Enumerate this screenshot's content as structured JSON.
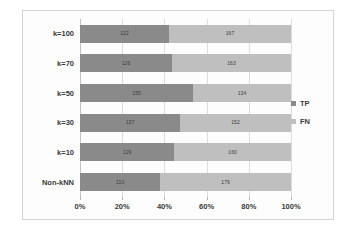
{
  "chart_data": {
    "type": "bar",
    "orientation": "horizontal",
    "stacked": true,
    "normalized_percent": true,
    "title": "",
    "xlabel": "",
    "ylabel": "",
    "categories": [
      "k=100",
      "k=70",
      "k=50",
      "k=30",
      "k=10",
      "Non-kNN"
    ],
    "series": [
      {
        "name": "TP",
        "color": "#8a8a8a",
        "values": [
          122,
          126,
          155,
          137,
          129,
          110
        ]
      },
      {
        "name": "FN",
        "color": "#bfbfbf",
        "values": [
          167,
          163,
          134,
          152,
          160,
          179
        ]
      }
    ],
    "row_totals": [
      289,
      289,
      289,
      289,
      289,
      289
    ],
    "xlim": [
      0,
      100
    ],
    "xticks": [
      0,
      20,
      40,
      60,
      80,
      100
    ],
    "xtick_labels": [
      "0%",
      "20%",
      "40%",
      "60%",
      "80%",
      "100%"
    ],
    "grid": true,
    "grid_axis": "x",
    "legend_position": "right"
  },
  "legend": {
    "entries": [
      {
        "label": "TP",
        "color": "#8a8a8a"
      },
      {
        "label": "FN",
        "color": "#bfbfbf"
      }
    ]
  }
}
